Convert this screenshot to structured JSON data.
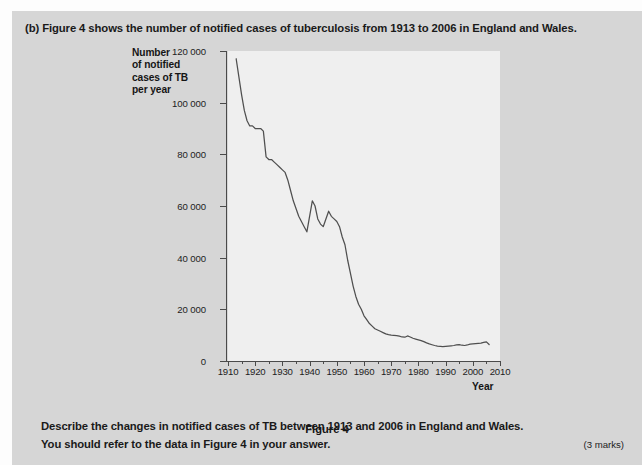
{
  "question": {
    "stem": "(b) Figure 4 shows the number of notified cases of tuberculosis from 1913 to 2006 in England and Wales.",
    "task_line_1": "Describe the changes in notified cases of TB between 1913 and 2006 in England and Wales.",
    "task_line_2": "You should refer to the data in Figure 4 in your answer.",
    "marks": "(3 marks)",
    "figure_caption": "Figure 4"
  },
  "colors": {
    "page_background": "#d6d6d6",
    "plot_background": "#efefef",
    "axis": "#4a4a4a",
    "line": "#4f4f4f",
    "text": "#1a1a1a"
  },
  "chart_data": {
    "type": "line",
    "title": "Figure 4",
    "xlabel": "Year",
    "ylabel": "Number of notified cases of TB per year",
    "ylabel_lines": [
      "Number",
      "of notified",
      "cases of TB",
      "per year"
    ],
    "xlim": [
      1910,
      2010
    ],
    "ylim": [
      0,
      120000
    ],
    "xticks": [
      1910,
      1920,
      1930,
      1940,
      1950,
      1960,
      1970,
      1980,
      1990,
      2000,
      2010
    ],
    "xtick_labels": [
      "1910",
      "1920",
      "1930",
      "1940",
      "1950",
      "1960",
      "1970",
      "1980",
      "1990",
      "2000",
      "2010"
    ],
    "yticks": [
      0,
      20000,
      40000,
      60000,
      80000,
      100000,
      120000
    ],
    "ytick_labels": [
      "0",
      "20 000",
      "40 000",
      "60 000",
      "80 000",
      "100 000",
      "120 000"
    ],
    "minor_xtick_interval": 5,
    "grid": false,
    "legend": null,
    "series": [
      {
        "name": "Notified cases of TB, England and Wales",
        "x": [
          1913,
          1914,
          1915,
          1916,
          1917,
          1918,
          1919,
          1920,
          1921,
          1922,
          1923,
          1924,
          1925,
          1926,
          1927,
          1928,
          1929,
          1930,
          1931,
          1932,
          1933,
          1934,
          1935,
          1936,
          1937,
          1938,
          1939,
          1940,
          1941,
          1942,
          1943,
          1944,
          1945,
          1946,
          1947,
          1948,
          1949,
          1950,
          1951,
          1952,
          1953,
          1954,
          1955,
          1956,
          1957,
          1958,
          1959,
          1960,
          1961,
          1962,
          1963,
          1964,
          1965,
          1966,
          1967,
          1968,
          1969,
          1970,
          1971,
          1972,
          1973,
          1974,
          1975,
          1976,
          1977,
          1978,
          1979,
          1980,
          1981,
          1982,
          1983,
          1984,
          1985,
          1986,
          1987,
          1988,
          1989,
          1990,
          1991,
          1992,
          1993,
          1994,
          1995,
          1996,
          1997,
          1998,
          1999,
          2000,
          2001,
          2002,
          2003,
          2004,
          2005,
          2006
        ],
        "y": [
          117000,
          110000,
          103000,
          97000,
          93000,
          91000,
          91000,
          90000,
          90000,
          90000,
          89000,
          79000,
          78000,
          78000,
          77000,
          76000,
          75000,
          74000,
          73000,
          70000,
          66000,
          62000,
          59000,
          56000,
          54000,
          52000,
          50000,
          56000,
          62000,
          60000,
          55000,
          53000,
          52000,
          55000,
          58000,
          56000,
          55000,
          54000,
          52000,
          48000,
          45000,
          39000,
          34000,
          29000,
          25000,
          22000,
          20000,
          17500,
          16000,
          14500,
          13500,
          12500,
          12000,
          11500,
          11000,
          10500,
          10200,
          10000,
          9900,
          9800,
          9600,
          9300,
          9200,
          9700,
          9300,
          8800,
          8500,
          8200,
          7900,
          7500,
          7000,
          6600,
          6300,
          6000,
          5800,
          5700,
          5600,
          5700,
          5800,
          5900,
          6000,
          6200,
          6300,
          6100,
          6000,
          6200,
          6500,
          6600,
          6700,
          6800,
          6900,
          7200,
          7400,
          6400
        ]
      }
    ],
    "annotations": [
      {
        "text": "peak at start ~117 000 in 1913"
      },
      {
        "text": "wartime rise around 1940-1941"
      },
      {
        "text": "steep fall through the 1950s"
      },
      {
        "text": "levels off below 10 000 after 1970"
      }
    ]
  }
}
